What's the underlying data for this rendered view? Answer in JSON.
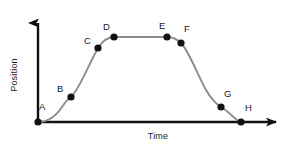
{
  "chart_data": {
    "type": "line",
    "title": "",
    "xlabel": "Time",
    "ylabel": "Position",
    "grid": false,
    "legend": null,
    "axis_style": "arrows",
    "xlim": [
      0,
      10
    ],
    "ylim": [
      0,
      10
    ],
    "annotations": [
      "A",
      "B",
      "C",
      "D",
      "E",
      "F",
      "G",
      "H"
    ],
    "points": [
      {
        "label": "A",
        "x": 0.0,
        "y": 0.0,
        "px": 38,
        "py": 122,
        "lx": 39,
        "ly": 102
      },
      {
        "label": "B",
        "x": 1.35,
        "y": 2.3,
        "px": 71,
        "py": 97,
        "lx": 57,
        "ly": 84
      },
      {
        "label": "C",
        "x": 2.43,
        "y": 6.9,
        "px": 98,
        "py": 48,
        "lx": 84,
        "ly": 36
      },
      {
        "label": "D",
        "x": 3.08,
        "y": 8.0,
        "px": 114,
        "py": 37,
        "lx": 103,
        "ly": 22
      },
      {
        "label": "E",
        "x": 5.22,
        "y": 8.0,
        "px": 167,
        "py": 37,
        "lx": 159,
        "ly": 21
      },
      {
        "label": "F",
        "x": 5.78,
        "y": 7.45,
        "px": 181,
        "py": 43,
        "lx": 184,
        "ly": 24
      },
      {
        "label": "G",
        "x": 7.4,
        "y": 1.45,
        "px": 221,
        "py": 107,
        "lx": 224,
        "ly": 89
      },
      {
        "label": "H",
        "x": 8.18,
        "y": 0.0,
        "px": 241,
        "py": 122,
        "lx": 245,
        "ly": 103
      }
    ],
    "colors": {
      "axis": "#111111",
      "curve": "#8c8c8c",
      "marker": "#111111",
      "text": "#1a1a1a",
      "background": "#ffffff"
    },
    "geometry": {
      "origin": {
        "x": 38,
        "y": 122
      },
      "y_axis_top": {
        "x": 38,
        "y": 14
      },
      "x_axis_right": {
        "x": 286,
        "y": 122
      },
      "marker_radius": 3.6,
      "curve_width": 1.9,
      "axis_width": 2.4,
      "curve_path": "M 38 122 C 48 122 56 116 62 107 C 66 101 68 99 71 97 C 79 90 88 66 98 48 C 103 40 108 37 114 37 L 167 37 C 173 37 177 39 181 43 C 189 51 198 76 206 90 C 212 100 216 104 221 107 C 228 111 233 117 237 120 C 239 121 240 122 241 122"
    }
  }
}
